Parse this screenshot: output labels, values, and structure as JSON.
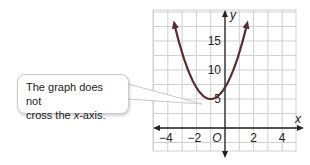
{
  "callout": {
    "line1": "The graph does not",
    "line2_prefix": "cross the ",
    "line2_var": "x",
    "line2_suffix": "-axis."
  },
  "colors": {
    "curve": "#5a2b30",
    "grid": "#d0d0d0",
    "axis": "#222222",
    "callout_border": "#c9c9c9"
  },
  "chart_data": {
    "type": "line",
    "title": "",
    "xlabel": "x",
    "ylabel": "y",
    "xlim": [
      -5,
      5
    ],
    "ylim": [
      -5,
      20
    ],
    "x_ticks": [
      -4,
      -2,
      2,
      4
    ],
    "y_ticks": [
      5,
      10,
      15
    ],
    "origin_label": "O",
    "grid": true,
    "series": [
      {
        "name": "parabola",
        "equation": "y = 2x^2 + 4x + 7",
        "vertex": [
          -1,
          5
        ],
        "y_intercept": 7,
        "x": [
          -3.6,
          -3,
          -2,
          -1,
          0,
          1,
          1.6
        ],
        "y": [
          18.5,
          13,
          7,
          5,
          7,
          13,
          18.5
        ]
      }
    ],
    "annotation": "The graph does not cross the x-axis."
  }
}
